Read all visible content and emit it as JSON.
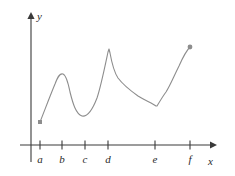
{
  "chart_data": {
    "type": "line",
    "title": "",
    "xlabel": "x",
    "ylabel": "y",
    "grid": false,
    "legend": null,
    "xlim": [
      0,
      1
    ],
    "ylim": [
      0,
      1
    ],
    "axis": {
      "x_axis_label": "x",
      "y_axis_label": "y",
      "x_tick_labels": [
        "a",
        "b",
        "c",
        "d",
        "e",
        "f"
      ],
      "y_tick_labels": [],
      "x_tick_positions": [
        40,
        62,
        85,
        108,
        155,
        190
      ],
      "origin": [
        31,
        145
      ],
      "x_axis_y": 145,
      "y_axis_x": 31,
      "x_axis_end": 215,
      "y_axis_top": 14
    },
    "series": [
      {
        "name": "f",
        "description": "Piecewise smooth curve with local max near b, local min near c, sharp vertical-tangent spike (cusp) at d, sharp corner minimum at e, then increasing to endpoint at f",
        "stroke_color": "#8d8d8d",
        "stroke_width": 1.1,
        "start_point": {
          "x": 40,
          "y": 122,
          "marker": "filled-square",
          "label": "open interval start"
        },
        "end_point": {
          "x": 190,
          "y": 47,
          "marker": "filled-circle",
          "label": "endpoint at f"
        },
        "path": "M40,122 C44,112 50,96 55,84 C58,76 60,73 63,74 C66,75 68,82 70,92 C73,104 76,114 82,116 C87,117 92,111 97,98 C101,86 105,66 108,52 L109,49 L110,53 C112,64 114,72 118,78 C124,86 131,91 138,96 C146,101 152,103 156,106 L157,106 C160,101 163,96 166,92 C170,86 174,76 179,66 C183,57 187,50 190,47",
        "critical_points": [
          {
            "label": "start",
            "x": 40,
            "y": 122,
            "kind": "left endpoint"
          },
          {
            "label": "b",
            "x": 62,
            "y": 74,
            "kind": "local maximum"
          },
          {
            "label": "c",
            "x": 85,
            "y": 116,
            "kind": "local minimum"
          },
          {
            "label": "d",
            "x": 109,
            "y": 49,
            "kind": "cusp / sharp peak"
          },
          {
            "label": "e",
            "x": 156,
            "y": 106,
            "kind": "corner / local minimum"
          },
          {
            "label": "f",
            "x": 190,
            "y": 47,
            "kind": "right endpoint"
          }
        ]
      }
    ]
  },
  "figure": {
    "background_color": "#ffffff",
    "axis_color": "#3a3a3a",
    "curve_color": "#8d8d8d",
    "text_color": "#2b2b2b",
    "y_label": "y",
    "x_label": "x",
    "tick_labels": [
      "a",
      "b",
      "c",
      "d",
      "e",
      "f"
    ]
  }
}
